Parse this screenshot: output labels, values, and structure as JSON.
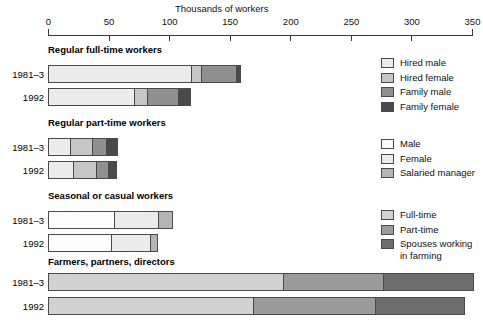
{
  "chart_data": {
    "type": "bar",
    "orientation": "horizontal",
    "title": "Thousands of workers",
    "xlabel": "Thousands of workers",
    "ylabel": "",
    "xlim": [
      0,
      350
    ],
    "xticks": [
      0,
      50,
      100,
      150,
      200,
      250,
      300,
      350
    ],
    "xtick_labels": [
      "0",
      "50",
      "100",
      "150",
      "200",
      "250",
      "300",
      "350"
    ],
    "grid": false,
    "legend_position": "right",
    "stacked": true,
    "groups": [
      {
        "title": "Regular full-time workers",
        "legend_set": "hired_family",
        "rows": [
          {
            "label": "1981–3",
            "segments": [
              {
                "name": "Hired male",
                "value": 119
              },
              {
                "name": "Hired female",
                "value": 9
              },
              {
                "name": "Family male",
                "value": 29
              },
              {
                "name": "Family female",
                "value": 2
              }
            ],
            "total": 159
          },
          {
            "label": "1992",
            "segments": [
              {
                "name": "Hired male",
                "value": 72
              },
              {
                "name": "Hired female",
                "value": 11
              },
              {
                "name": "Family male",
                "value": 26
              },
              {
                "name": "Family female",
                "value": 9
              }
            ],
            "total": 118
          }
        ]
      },
      {
        "title": "Regular part-time workers",
        "legend_set": "hired_family",
        "rows": [
          {
            "label": "1981–3",
            "segments": [
              {
                "name": "Hired male",
                "value": 19
              },
              {
                "name": "Hired female",
                "value": 18
              },
              {
                "name": "Family male",
                "value": 12
              },
              {
                "name": "Family female",
                "value": 9
              }
            ],
            "total": 58
          },
          {
            "label": "1992",
            "segments": [
              {
                "name": "Hired male",
                "value": 21
              },
              {
                "name": "Hired female",
                "value": 20
              },
              {
                "name": "Family male",
                "value": 10
              },
              {
                "name": "Family female",
                "value": 6
              }
            ],
            "total": 57
          }
        ]
      },
      {
        "title": "Seasonal or casual workers",
        "legend_set": "male_female_manager",
        "rows": [
          {
            "label": "1981–3",
            "segments": [
              {
                "name": "Male",
                "value": 55
              },
              {
                "name": "Female",
                "value": 37
              },
              {
                "name": "Salaried manager",
                "value": 11
              }
            ],
            "total": 103
          },
          {
            "label": "1992",
            "segments": [
              {
                "name": "Male",
                "value": 53
              },
              {
                "name": "Female",
                "value": 33
              },
              {
                "name": "Salaried manager",
                "value": 5
              }
            ],
            "total": 91
          }
        ]
      },
      {
        "title": "Farmers, partners, directors",
        "legend_set": "fulltime_parttime_spouses",
        "rows": [
          {
            "label": "1981–3",
            "segments": [
              {
                "name": "Full-time",
                "value": 195
              },
              {
                "name": "Part-time",
                "value": 83
              },
              {
                "name": "Spouses working in farming",
                "value": 74
              }
            ],
            "total": 352
          },
          {
            "label": "1992",
            "segments": [
              {
                "name": "Full-time",
                "value": 170
              },
              {
                "name": "Part-time",
                "value": 101
              },
              {
                "name": "Spouses working in farming",
                "value": 73
              }
            ],
            "total": 344
          }
        ]
      }
    ],
    "legends": [
      {
        "id": "hired_family",
        "entries": [
          {
            "label": "Hired male",
            "color": "#ececec"
          },
          {
            "label": "Hired female",
            "color": "#c6c6c6"
          },
          {
            "label": "Family male",
            "color": "#8f8f8f"
          },
          {
            "label": "Family female",
            "color": "#4a4a4a"
          }
        ]
      },
      {
        "id": "male_female_manager",
        "entries": [
          {
            "label": "Male",
            "color": "#fdfdfd"
          },
          {
            "label": "Female",
            "color": "#ececec"
          },
          {
            "label": "Salaried manager",
            "color": "#b4b4b4"
          }
        ]
      },
      {
        "id": "fulltime_parttime_spouses",
        "entries": [
          {
            "label": "Full-time",
            "color": "#d2d2d2"
          },
          {
            "label": "Part-time",
            "color": "#9a9a9a"
          },
          {
            "label": "Spouses working\nin farming",
            "color": "#6e6e6e"
          }
        ]
      }
    ],
    "annotations": []
  }
}
